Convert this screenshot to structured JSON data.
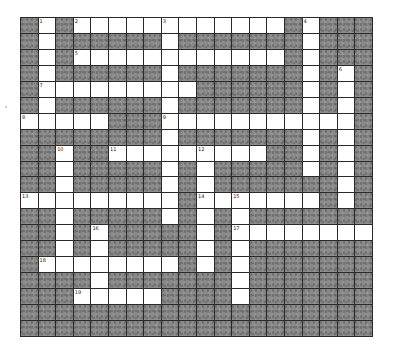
{
  "puzzle": {
    "rows": 20,
    "cols": 20,
    "colors": {
      "white": "#ffffff",
      "block": "#8a8a8a",
      "grid_line": "#2a2a2a"
    },
    "layout": [
      "BWBWWWWWWWWWWWWBWBBB",
      "BWBBBBBBWBBBBBBBWBBB",
      "BWBWWWWWWWWWWWWBWBBB",
      "BWBBBBBBWBBBBBBBWBWB",
      "BWWWWWWWWWBBBBBBWBWB",
      "BWBBBBBBWBBBBBBBWBWB",
      "WWWWWBBBWWWWWWWWWWWB",
      "BBBBBBBBWBBBBBBBWBWB",
      "BBWBBWWWWWWWWWBBWBWB",
      "BBWBBBBBWBWBBBBBWBWB",
      "BBWBBBBBWBWBBBBBBBWB",
      "WWWWWWWWWBWWWWWWWBWB",
      "BBWBBBBBWBWBWBBBBBBB",
      "BBWBWBBBBBWBWWWWWWWW",
      "BBWBWBBBBBWBWBBBBBBB",
      "BWWWWWWWWBWBWBBBBBBB",
      "BBBBWBBBBBBBWBBBBBBB",
      "BBBWWWWWBBBBWBBBBBBB",
      "BBBBBBBBBBBBBBBBBBBB",
      "BBBBBBBBBBBBBBBBBBBB"
    ],
    "numbers": [
      {
        "row": 0,
        "col": 1,
        "label": "1"
      },
      {
        "row": 0,
        "col": 3,
        "label": "2"
      },
      {
        "row": 0,
        "col": 8,
        "label": "3"
      },
      {
        "row": 0,
        "col": 16,
        "label": "4"
      },
      {
        "row": 2,
        "col": 3,
        "label": "5"
      },
      {
        "row": 3,
        "col": 18,
        "label": "6"
      },
      {
        "row": 4,
        "col": 1,
        "label": "7"
      },
      {
        "row": 6,
        "col": 0,
        "label": "8"
      },
      {
        "row": 6,
        "col": 8,
        "label": "9"
      },
      {
        "row": 8,
        "col": 2,
        "label": "10"
      },
      {
        "row": 8,
        "col": 5,
        "label": "11"
      },
      {
        "row": 8,
        "col": 10,
        "label": "12"
      },
      {
        "row": 11,
        "col": 0,
        "label": "13"
      },
      {
        "row": 11,
        "col": 10,
        "label": "14"
      },
      {
        "row": 11,
        "col": 12,
        "label": "15"
      },
      {
        "row": 13,
        "col": 4,
        "label": "16"
      },
      {
        "row": 13,
        "col": 12,
        "label": "17"
      },
      {
        "row": 15,
        "col": 1,
        "label": "18"
      },
      {
        "row": 17,
        "col": 3,
        "label": "19"
      }
    ]
  }
}
